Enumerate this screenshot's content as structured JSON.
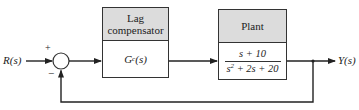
{
  "diagram": {
    "type": "feedback control block diagram",
    "input": {
      "label": "R(s)"
    },
    "output": {
      "label": "Y(s)"
    },
    "summing_junction": {
      "plus_sign": "+",
      "minus_sign": "−"
    },
    "blocks": [
      {
        "title_line1": "Lag",
        "title_line2": "compensator",
        "tf_main": "G",
        "tf_sub": "c",
        "tf_arg": "(s)"
      },
      {
        "title": "Plant",
        "numerator": "s + 10",
        "denominator_pre": "s",
        "denominator_exp": "2",
        "denominator_post": " + 2s + 20"
      }
    ],
    "colors": {
      "line": "#222222",
      "header_fill": "#dcdcdc"
    }
  }
}
